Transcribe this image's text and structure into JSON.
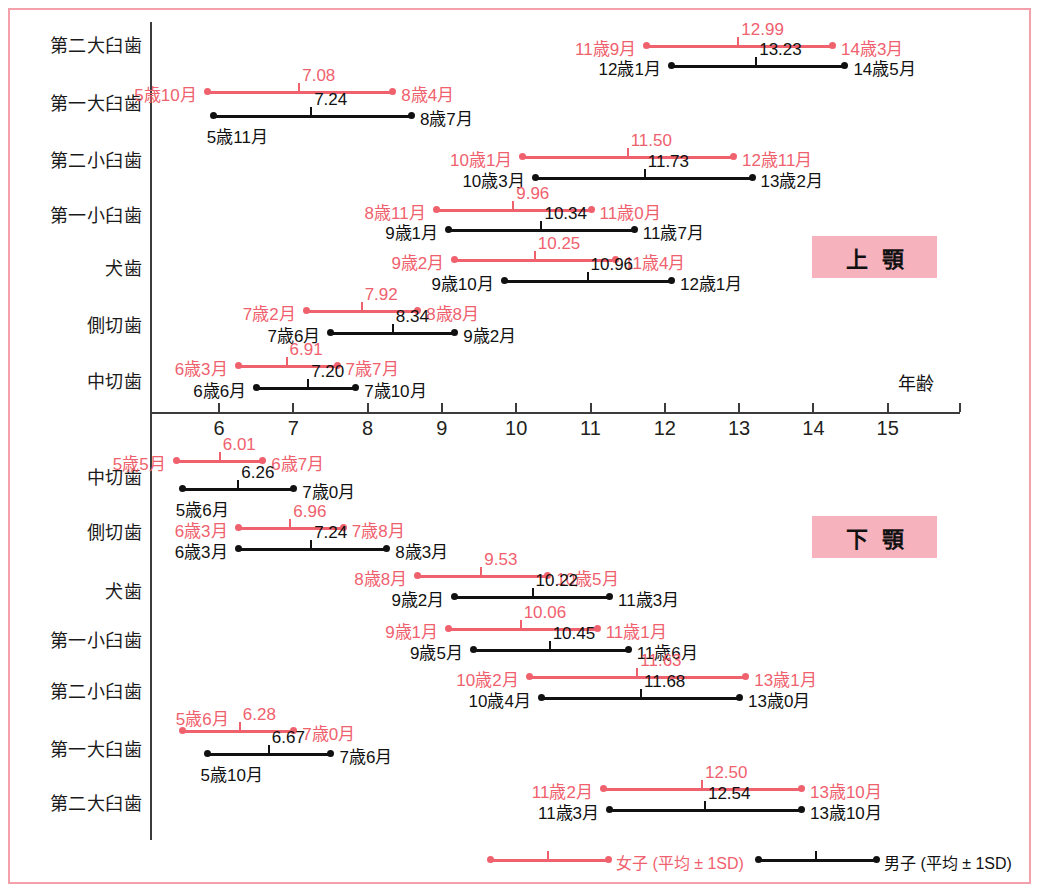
{
  "colors": {
    "female": "#f0616e",
    "male": "#111111",
    "frame": "#f4a0ab",
    "jaw_box_bg": "#f7b3bd",
    "axis": "#3b3b3b"
  },
  "axis": {
    "label": "年齢",
    "ticks": [
      "6",
      "7",
      "8",
      "9",
      "10",
      "11",
      "12",
      "13",
      "14",
      "15"
    ],
    "min": 5.0,
    "max": 15.95
  },
  "jaw_sections": [
    {
      "name": "上　顎",
      "box_text": "上顎"
    },
    {
      "name": "下　顎",
      "box_text": "下顎"
    }
  ],
  "legend": {
    "female": "女子 (平均 ± 1SD)",
    "male": "男子 (平均 ± 1SD)"
  },
  "chart_data": {
    "type": "line",
    "xlabel": "年齢",
    "ylabel": "",
    "xlim": [
      5.0,
      15.95
    ],
    "grid": false,
    "legend_position": "bottom",
    "series_names": [
      "女子 (平均 ± 1SD)",
      "男子 (平均 ± 1SD)"
    ],
    "upper_jaw": [
      {
        "tooth": "第二大臼歯",
        "female": {
          "start_label": "11歳9月",
          "start": 11.75,
          "mean": 12.99,
          "mean_label": "12.99",
          "end_label": "14歳3月",
          "end": 14.25
        },
        "male": {
          "start_label": "12歳1月",
          "start": 12.083,
          "mean": 13.23,
          "mean_label": "13.23",
          "end_label": "14歳5月",
          "end": 14.417
        }
      },
      {
        "tooth": "第一大臼歯",
        "female": {
          "start_label": "5歳10月",
          "start": 5.833,
          "mean": 7.08,
          "mean_label": "7.08",
          "end_label": "8歳4月",
          "end": 8.333
        },
        "male": {
          "start_label": "5歳11月",
          "start": 5.917,
          "mean": 7.24,
          "mean_label": "7.24",
          "end_label": "8歳7月",
          "end": 8.583
        }
      },
      {
        "tooth": "第二小臼歯",
        "female": {
          "start_label": "10歳1月",
          "start": 10.083,
          "mean": 11.5,
          "mean_label": "11.50",
          "end_label": "12歳11月",
          "end": 12.917
        },
        "male": {
          "start_label": "10歳3月",
          "start": 10.25,
          "mean": 11.73,
          "mean_label": "11.73",
          "end_label": "13歳2月",
          "end": 13.167
        }
      },
      {
        "tooth": "第一小臼歯",
        "female": {
          "start_label": "8歳11月",
          "start": 8.917,
          "mean": 9.96,
          "mean_label": "9.96",
          "end_label": "11歳0月",
          "end": 11.0
        },
        "male": {
          "start_label": "9歳1月",
          "start": 9.083,
          "mean": 10.34,
          "mean_label": "10.34",
          "end_label": "11歳7月",
          "end": 11.583
        }
      },
      {
        "tooth": "犬歯",
        "female": {
          "start_label": "9歳2月",
          "start": 9.167,
          "mean": 10.25,
          "mean_label": "10.25",
          "end_label": "11歳4月",
          "end": 11.333
        },
        "male": {
          "start_label": "9歳10月",
          "start": 9.833,
          "mean": 10.96,
          "mean_label": "10.96",
          "end_label": "12歳1月",
          "end": 12.083
        }
      },
      {
        "tooth": "側切歯",
        "female": {
          "start_label": "7歳2月",
          "start": 7.167,
          "mean": 7.92,
          "mean_label": "7.92",
          "end_label": "8歳8月",
          "end": 8.667
        },
        "male": {
          "start_label": "7歳6月",
          "start": 7.5,
          "mean": 8.34,
          "mean_label": "8.34",
          "end_label": "9歳2月",
          "end": 9.167
        }
      },
      {
        "tooth": "中切歯",
        "female": {
          "start_label": "6歳3月",
          "start": 6.25,
          "mean": 6.91,
          "mean_label": "6.91",
          "end_label": "7歳7月",
          "end": 7.583
        },
        "male": {
          "start_label": "6歳6月",
          "start": 6.5,
          "mean": 7.2,
          "mean_label": "7.20",
          "end_label": "7歳10月",
          "end": 7.833
        }
      }
    ],
    "lower_jaw": [
      {
        "tooth": "中切歯",
        "female": {
          "start_label": "5歳5月",
          "start": 5.417,
          "mean": 6.01,
          "mean_label": "6.01",
          "end_label": "6歳7月",
          "end": 6.583
        },
        "male": {
          "start_label": "5歳6月",
          "start": 5.5,
          "mean": 6.26,
          "mean_label": "6.26",
          "end_label": "7歳0月",
          "end": 7.0
        }
      },
      {
        "tooth": "側切歯",
        "female": {
          "start_label": "6歳3月",
          "start": 6.25,
          "mean": 6.96,
          "mean_label": "6.96",
          "end_label": "7歳8月",
          "end": 7.667
        },
        "male": {
          "start_label": "6歳3月",
          "start": 6.25,
          "mean": 7.24,
          "mean_label": "7.24",
          "end_label": "8歳3月",
          "end": 8.25
        }
      },
      {
        "tooth": "犬歯",
        "female": {
          "start_label": "8歳8月",
          "start": 8.667,
          "mean": 9.53,
          "mean_label": "9.53",
          "end_label": "10歳5月",
          "end": 10.417
        },
        "male": {
          "start_label": "9歳2月",
          "start": 9.167,
          "mean": 10.22,
          "mean_label": "10.22",
          "end_label": "11歳3月",
          "end": 11.25
        }
      },
      {
        "tooth": "第一小臼歯",
        "female": {
          "start_label": "9歳1月",
          "start": 9.083,
          "mean": 10.06,
          "mean_label": "10.06",
          "end_label": "11歳1月",
          "end": 11.083
        },
        "male": {
          "start_label": "9歳5月",
          "start": 9.417,
          "mean": 10.45,
          "mean_label": "10.45",
          "end_label": "11歳6月",
          "end": 11.5
        }
      },
      {
        "tooth": "第二小臼歯",
        "female": {
          "start_label": "10歳2月",
          "start": 10.167,
          "mean": 11.63,
          "mean_label": "11.63",
          "end_label": "13歳1月",
          "end": 13.083
        },
        "male": {
          "start_label": "10歳4月",
          "start": 10.333,
          "mean": 11.68,
          "mean_label": "11.68",
          "end_label": "13歳0月",
          "end": 13.0
        }
      },
      {
        "tooth": "第一大臼歯",
        "female": {
          "start_label": "5歳6月",
          "start": 5.5,
          "mean": 6.28,
          "mean_label": "6.28",
          "end_label": "7歳0月",
          "end": 7.0
        },
        "male": {
          "start_label": "5歳10月",
          "start": 5.833,
          "mean": 6.67,
          "mean_label": "6.67",
          "end_label": "7歳6月",
          "end": 7.5
        }
      },
      {
        "tooth": "第二大臼歯",
        "female": {
          "start_label": "11歳2月",
          "start": 11.167,
          "mean": 12.5,
          "mean_label": "12.50",
          "end_label": "13歳10月",
          "end": 13.833
        },
        "male": {
          "start_label": "11歳3月",
          "start": 11.25,
          "mean": 12.54,
          "mean_label": "12.54",
          "end_label": "13歳10月",
          "end": 13.833
        }
      }
    ]
  },
  "layout": {
    "upper_rows": [
      {
        "label_y": 42,
        "f_y": 46,
        "m_y": 66,
        "f_lbl": "left-out",
        "m_lbl": "left-out"
      },
      {
        "label_y": 100,
        "f_y": 92,
        "m_y": 116,
        "f_lbl": "left-out",
        "m_lbl": "below"
      },
      {
        "label_y": 157,
        "f_y": 157,
        "m_y": 178,
        "f_lbl": "left-out",
        "m_lbl": "left-out"
      },
      {
        "label_y": 212,
        "f_y": 210,
        "m_y": 230,
        "f_lbl": "left-out",
        "m_lbl": "left-out"
      },
      {
        "label_y": 265,
        "f_y": 260,
        "m_y": 281,
        "f_lbl": "left-out",
        "m_lbl": "left-out"
      },
      {
        "label_y": 322,
        "f_y": 311,
        "m_y": 333,
        "f_lbl": "left-out",
        "m_lbl": "left-out"
      },
      {
        "label_y": 378,
        "f_y": 366,
        "m_y": 388,
        "f_lbl": "left-out",
        "m_lbl": "left-out"
      }
    ],
    "lower_rows": [
      {
        "label_y": 474,
        "f_y": 461,
        "m_y": 489,
        "f_lbl": "left-out",
        "m_lbl": "below"
      },
      {
        "label_y": 529,
        "f_y": 528,
        "m_y": 549,
        "f_lbl": "left-out",
        "m_lbl": "left-out"
      },
      {
        "label_y": 588,
        "f_y": 576,
        "m_y": 597,
        "f_lbl": "left-out",
        "m_lbl": "left-out"
      },
      {
        "label_y": 637,
        "f_y": 629,
        "m_y": 650,
        "f_lbl": "left-out",
        "m_lbl": "left-out"
      },
      {
        "label_y": 688,
        "f_y": 677,
        "m_y": 698,
        "f_lbl": "left-out",
        "m_lbl": "left-out"
      },
      {
        "label_y": 746,
        "f_y": 731,
        "m_y": 754,
        "f_lbl": "above",
        "m_lbl": "below"
      },
      {
        "label_y": 800,
        "f_y": 789,
        "m_y": 810,
        "f_lbl": "left-out",
        "m_lbl": "left-out"
      }
    ]
  }
}
